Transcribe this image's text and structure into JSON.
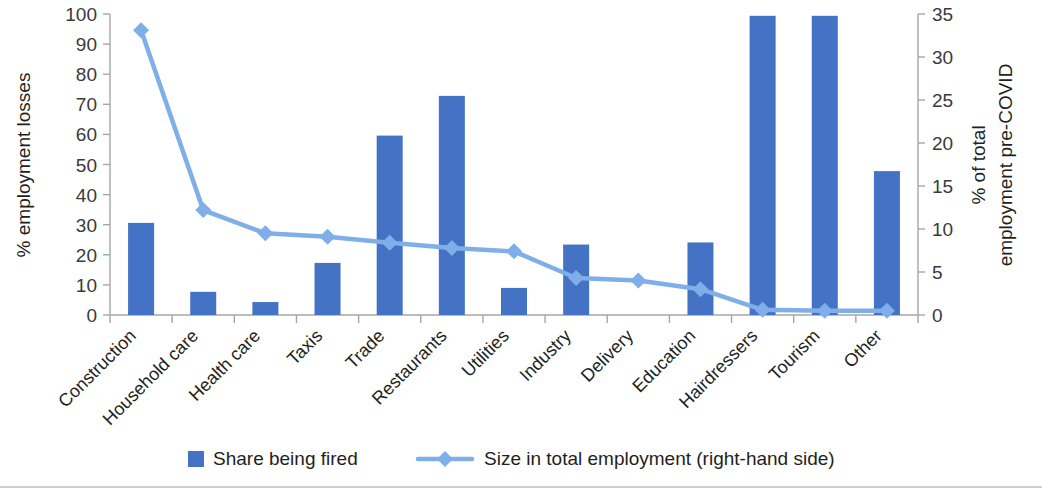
{
  "chart_data": {
    "type": "bar",
    "title": "",
    "subtitle": "",
    "categories": [
      "Construction",
      "Household care",
      "Health care",
      "Taxis",
      "Trade",
      "Restaurants",
      "Utilities",
      "Industry",
      "Delivery",
      "Education",
      "Hairdressers",
      "Tourism",
      "Other"
    ],
    "series": [
      {
        "name": "Share being fired",
        "type": "bar",
        "axis": "left",
        "color": "#4472C4",
        "values": [
          30.6,
          7.7,
          4.3,
          17.3,
          59.6,
          72.8,
          9.0,
          23.4,
          0,
          24.1,
          99.4,
          99.4,
          47.8
        ]
      },
      {
        "name": "Size in total employment (right-hand side)",
        "type": "line",
        "axis": "right",
        "color": "#7FAEE8",
        "marker": "diamond",
        "values": [
          33.1,
          12.2,
          9.5,
          9.1,
          8.4,
          7.8,
          7.4,
          4.3,
          4.0,
          3.0,
          0.6,
          0.5,
          0.5
        ]
      }
    ],
    "xlabel": "",
    "ylabel": "% employment losses",
    "y2label": "% of total employment pre-COVID",
    "ylim": [
      0,
      100
    ],
    "y2lim": [
      0,
      35
    ],
    "yticks": [
      0,
      10,
      20,
      30,
      40,
      50,
      60,
      70,
      80,
      90,
      100
    ],
    "y2ticks": [
      0,
      5,
      10,
      15,
      20,
      25,
      30,
      35
    ],
    "grid": false,
    "legend_position": "bottom",
    "xtick_rotation": -45
  },
  "axes": {
    "left_title": "% employment losses",
    "right_title_line1": "% of total",
    "right_title_line2": "employment pre-COVID",
    "left_ticks": [
      "100",
      "90",
      "80",
      "70",
      "60",
      "50",
      "40",
      "30",
      "20",
      "10",
      "0"
    ],
    "right_ticks": [
      "35",
      "30",
      "25",
      "20",
      "15",
      "10",
      "5",
      "0"
    ]
  },
  "legend": {
    "items": [
      {
        "label": "Share being fired",
        "marker": "square",
        "color": "#4472C4"
      },
      {
        "label": "Size in total employment (right-hand side)",
        "marker": "line-diamond",
        "color": "#7FAEE8"
      }
    ]
  }
}
